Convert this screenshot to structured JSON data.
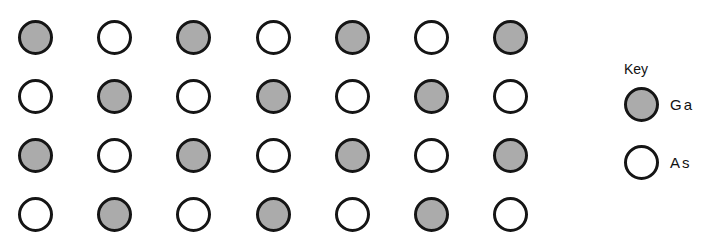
{
  "diagram": {
    "grid": {
      "rows": 4,
      "cols": 7,
      "cells": [
        [
          "Ga",
          "As",
          "Ga",
          "As",
          "Ga",
          "As",
          "Ga"
        ],
        [
          "As",
          "Ga",
          "As",
          "Ga",
          "As",
          "Ga",
          "As"
        ],
        [
          "Ga",
          "As",
          "Ga",
          "As",
          "Ga",
          "As",
          "Ga"
        ],
        [
          "As",
          "Ga",
          "As",
          "Ga",
          "As",
          "Ga",
          "As"
        ]
      ]
    },
    "key": {
      "title": "Key",
      "items": [
        {
          "species": "Ga",
          "label": "Ga",
          "fill": "stippled-gray",
          "color": "#c9c9c9"
        },
        {
          "species": "As",
          "label": "As",
          "fill": "white",
          "color": "#ffffff"
        }
      ]
    }
  }
}
